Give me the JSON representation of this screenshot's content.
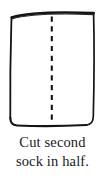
{
  "illustration": {
    "name": "sock-diagram",
    "description": "hand-drawn rectangle with vertical dashed cut line down the center",
    "shape": "rectangle",
    "stroke_color": "#141414",
    "fill_color": "#ffffff",
    "cut_line": {
      "name": "dashed-cut-line",
      "orientation": "vertical",
      "style": "dashed",
      "color": "#141414",
      "dash_count": 11
    }
  },
  "caption": {
    "full_text": "Cut second sock in half.",
    "lines": [
      "Cut second",
      "sock in half."
    ],
    "color": "#1a1a1a"
  }
}
